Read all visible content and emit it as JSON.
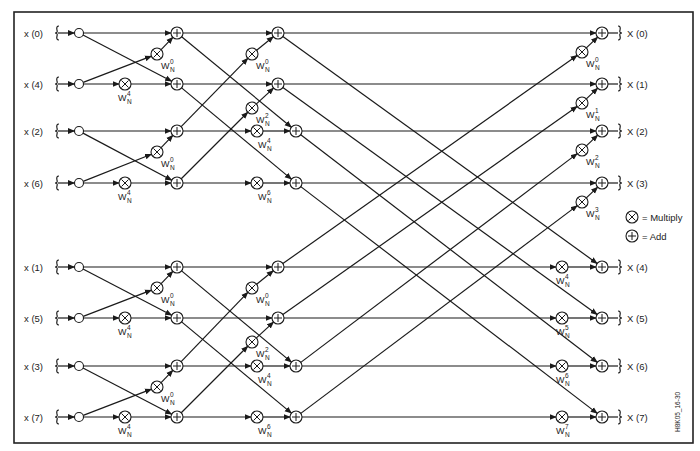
{
  "diagram": {
    "inputs": [
      "x (0)",
      "x (4)",
      "x (2)",
      "x (6)",
      "x (1)",
      "x (5)",
      "x (3)",
      "x (7)"
    ],
    "outputs": [
      "X (0)",
      "X (1)",
      "X (2)",
      "X (3)",
      "X (4)",
      "X (5)",
      "X (6)",
      "X (7)"
    ],
    "twiddle_base": "W",
    "twiddle_subscript": "N",
    "stage1_twiddles": [
      "0",
      "4",
      "0",
      "4",
      "0",
      "4",
      "0",
      "4"
    ],
    "stage2_twiddles": [
      "0",
      "2",
      "4",
      "6",
      "0",
      "2",
      "4",
      "6"
    ],
    "stage3_twiddles": [
      "0",
      "1",
      "2",
      "3",
      "4",
      "5",
      "6",
      "7"
    ],
    "legend": {
      "multiply": "= Multiply",
      "add": "= Add"
    },
    "figure_id": "H8K05_16-30",
    "colors": {
      "line": "#1a1a1a",
      "background": "#ffffff",
      "text": "#222222"
    }
  }
}
